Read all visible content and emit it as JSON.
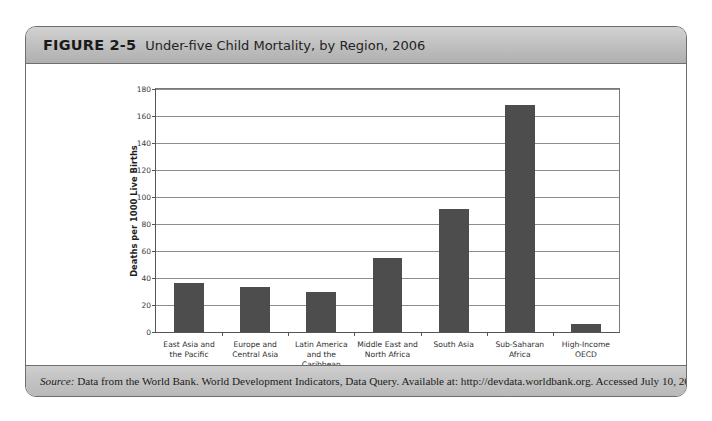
{
  "figure": {
    "label": "FIGURE 2-5",
    "title": "Under-five Child Mortality, by Region, 2006",
    "source_lead": "Source:",
    "source_body": " Data from the World Bank. World Development Indicators, Data Query. Available at: http://devdata.worldbank.org. Accessed July 10, 2006."
  },
  "colors": {
    "bar": "#4d4d4d",
    "header_bg": "#c4c4c4",
    "frame": "#6e6e6e",
    "gridline": "#8d8d8d"
  },
  "chart_data": {
    "type": "bar",
    "title": "Under-five Child Mortality, by Region, 2006",
    "xlabel": "WORLD BANK REGION/GROUP",
    "ylabel": "Deaths per 1000 Live Births",
    "ylim": [
      0,
      180
    ],
    "yticks": [
      0,
      20,
      40,
      60,
      80,
      100,
      120,
      140,
      160,
      180
    ],
    "ytick_labels": [
      "0",
      "20",
      "40",
      "60",
      "80",
      "100",
      "120",
      "140",
      "160",
      "180"
    ],
    "grid": true,
    "legend": false,
    "categories": [
      "East Asia and\nthe Pacific",
      "Europe and\nCentral Asia",
      "Latin America\nand the\nCaribbean",
      "Middle East and\nNorth Africa",
      "South Asia",
      "Sub-Saharan\nAfrica",
      "High-Income\nOECD"
    ],
    "values": [
      36,
      33,
      30,
      55,
      91,
      168,
      6
    ]
  }
}
